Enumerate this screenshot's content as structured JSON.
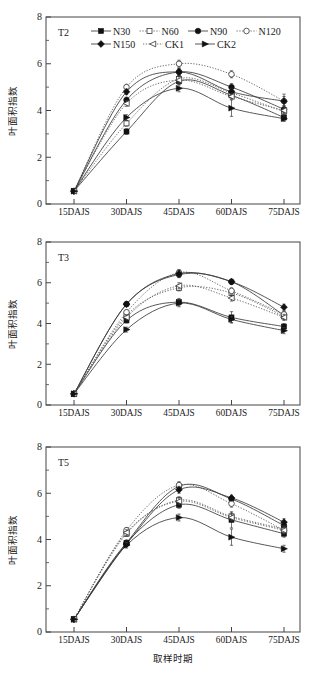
{
  "figure": {
    "y_axis_title": "叶面积指数",
    "x_axis_title": "取样时期",
    "categories": [
      "15DAJS",
      "30DAJS",
      "45DAJS",
      "60DAJS",
      "75DAJS"
    ],
    "y_ticks": [
      "0",
      "2",
      "4",
      "6",
      "8"
    ],
    "ylim": [
      0,
      8
    ],
    "line_color": "#3a3a3a",
    "marker_fill_color": "#111111",
    "marker_open_color": "#ffffff"
  },
  "legend": {
    "position": "top-inside-panel-1",
    "entries": [
      {
        "label": "N30",
        "marker": "filled-square",
        "line": "solid"
      },
      {
        "label": "N60",
        "marker": "open-square",
        "line": "dotted"
      },
      {
        "label": "N90",
        "marker": "filled-circle",
        "line": "solid"
      },
      {
        "label": "N120",
        "marker": "open-circle",
        "line": "dotted"
      },
      {
        "label": "N150",
        "marker": "filled-diamond",
        "line": "solid"
      },
      {
        "label": "CK1",
        "marker": "open-left-triangle",
        "line": "dotted"
      },
      {
        "label": "CK2",
        "marker": "filled-right-triangle",
        "line": "solid"
      }
    ]
  },
  "chart_data": [
    {
      "type": "line",
      "panel_label": "T2",
      "title": "",
      "xlabel": "取样时期",
      "ylabel": "叶面积指数",
      "categories": [
        "15DAJS",
        "30DAJS",
        "45DAJS",
        "60DAJS",
        "75DAJS"
      ],
      "ylim": [
        0,
        8
      ],
      "grid": false,
      "series": [
        {
          "name": "N30",
          "marker": "filled-square",
          "line": "solid",
          "values": [
            0.55,
            3.1,
            5.25,
            4.65,
            3.7
          ],
          "errors": [
            0.05,
            0.12,
            0.15,
            0.12,
            0.12
          ]
        },
        {
          "name": "N60",
          "marker": "open-square",
          "line": "dotted",
          "values": [
            0.55,
            3.45,
            5.35,
            4.75,
            3.95
          ],
          "errors": [
            0.05,
            0.12,
            0.15,
            0.12,
            0.12
          ]
        },
        {
          "name": "N90",
          "marker": "filled-circle",
          "line": "solid",
          "values": [
            0.55,
            4.45,
            5.65,
            5.0,
            4.05
          ],
          "errors": [
            0.05,
            0.12,
            0.15,
            0.15,
            0.15
          ]
        },
        {
          "name": "N120",
          "marker": "open-circle",
          "line": "dotted",
          "values": [
            0.55,
            5.0,
            6.0,
            5.55,
            4.4
          ],
          "errors": [
            0.05,
            0.12,
            0.15,
            0.15,
            0.3
          ]
        },
        {
          "name": "N150",
          "marker": "filled-diamond",
          "line": "solid",
          "values": [
            0.55,
            4.8,
            5.65,
            4.8,
            4.4
          ],
          "errors": [
            0.05,
            0.12,
            0.15,
            0.15,
            0.2
          ]
        },
        {
          "name": "CK1",
          "marker": "open-left-triangle",
          "line": "dotted",
          "values": [
            0.55,
            4.3,
            5.3,
            4.6,
            4.0
          ],
          "errors": [
            0.05,
            0.12,
            0.15,
            0.12,
            0.12
          ]
        },
        {
          "name": "CK2",
          "marker": "filled-right-triangle",
          "line": "solid",
          "values": [
            0.55,
            3.7,
            4.95,
            4.1,
            3.65
          ],
          "errors": [
            0.05,
            0.12,
            0.15,
            0.35,
            0.12
          ]
        }
      ]
    },
    {
      "type": "line",
      "panel_label": "T3",
      "title": "",
      "xlabel": "取样时期",
      "ylabel": "叶面积指数",
      "categories": [
        "15DAJS",
        "30DAJS",
        "45DAJS",
        "60DAJS",
        "75DAJS"
      ],
      "ylim": [
        0,
        8
      ],
      "grid": false,
      "series": [
        {
          "name": "N30",
          "marker": "filled-square",
          "line": "solid",
          "values": [
            0.55,
            4.15,
            5.05,
            4.3,
            3.85
          ],
          "errors": [
            0.05,
            0.12,
            0.18,
            0.28,
            0.15
          ]
        },
        {
          "name": "N60",
          "marker": "open-square",
          "line": "dotted",
          "values": [
            0.55,
            4.4,
            5.75,
            5.5,
            4.35
          ],
          "errors": [
            0.05,
            0.12,
            0.15,
            0.15,
            0.15
          ]
        },
        {
          "name": "N90",
          "marker": "filled-circle",
          "line": "solid",
          "values": [
            0.55,
            4.95,
            6.4,
            6.05,
            4.4
          ],
          "errors": [
            0.05,
            0.12,
            0.15,
            0.12,
            0.15
          ]
        },
        {
          "name": "N120",
          "marker": "open-circle",
          "line": "dotted",
          "values": [
            0.55,
            4.55,
            6.5,
            5.6,
            4.45
          ],
          "errors": [
            0.05,
            0.12,
            0.15,
            0.15,
            0.15
          ]
        },
        {
          "name": "N150",
          "marker": "filled-diamond",
          "line": "solid",
          "values": [
            0.55,
            4.95,
            6.45,
            6.05,
            4.8
          ],
          "errors": [
            0.05,
            0.12,
            0.15,
            0.12,
            0.15
          ]
        },
        {
          "name": "CK1",
          "marker": "open-left-triangle",
          "line": "dotted",
          "values": [
            0.55,
            4.3,
            5.85,
            5.25,
            4.3
          ],
          "errors": [
            0.05,
            0.12,
            0.15,
            0.15,
            0.15
          ]
        },
        {
          "name": "CK2",
          "marker": "filled-right-triangle",
          "line": "solid",
          "values": [
            0.55,
            3.7,
            5.0,
            4.2,
            3.65
          ],
          "errors": [
            0.05,
            0.12,
            0.18,
            0.15,
            0.15
          ]
        }
      ]
    },
    {
      "type": "line",
      "panel_label": "T5",
      "title": "",
      "xlabel": "取样时期",
      "ylabel": "叶面积指数",
      "categories": [
        "15DAJS",
        "30DAJS",
        "45DAJS",
        "60DAJS",
        "75DAJS"
      ],
      "ylim": [
        0,
        8
      ],
      "grid": false,
      "series": [
        {
          "name": "N30",
          "marker": "filled-square",
          "line": "solid",
          "values": [
            0.55,
            3.85,
            5.5,
            4.85,
            4.25
          ],
          "errors": [
            0.05,
            0.12,
            0.15,
            0.35,
            0.15
          ]
        },
        {
          "name": "N60",
          "marker": "open-square",
          "line": "dotted",
          "values": [
            0.55,
            4.25,
            5.7,
            5.0,
            4.45
          ],
          "errors": [
            0.05,
            0.12,
            0.15,
            0.15,
            0.15
          ]
        },
        {
          "name": "N90",
          "marker": "filled-circle",
          "line": "solid",
          "values": [
            0.55,
            3.85,
            6.3,
            5.75,
            4.6
          ],
          "errors": [
            0.05,
            0.12,
            0.15,
            0.12,
            0.15
          ]
        },
        {
          "name": "N120",
          "marker": "open-circle",
          "line": "dotted",
          "values": [
            0.55,
            4.4,
            6.35,
            5.55,
            4.4
          ],
          "errors": [
            0.05,
            0.12,
            0.15,
            0.15,
            0.15
          ]
        },
        {
          "name": "N150",
          "marker": "filled-diamond",
          "line": "solid",
          "values": [
            0.55,
            3.8,
            6.15,
            5.8,
            4.75
          ],
          "errors": [
            0.05,
            0.12,
            0.15,
            0.12,
            0.15
          ]
        },
        {
          "name": "CK1",
          "marker": "open-left-triangle",
          "line": "dotted",
          "values": [
            0.55,
            4.3,
            5.65,
            4.95,
            4.4
          ],
          "errors": [
            0.05,
            0.12,
            0.15,
            0.15,
            0.15
          ]
        },
        {
          "name": "CK2",
          "marker": "filled-right-triangle",
          "line": "solid",
          "values": [
            0.55,
            3.75,
            4.95,
            4.1,
            3.6
          ],
          "errors": [
            0.05,
            0.12,
            0.15,
            0.35,
            0.15
          ]
        }
      ]
    }
  ]
}
